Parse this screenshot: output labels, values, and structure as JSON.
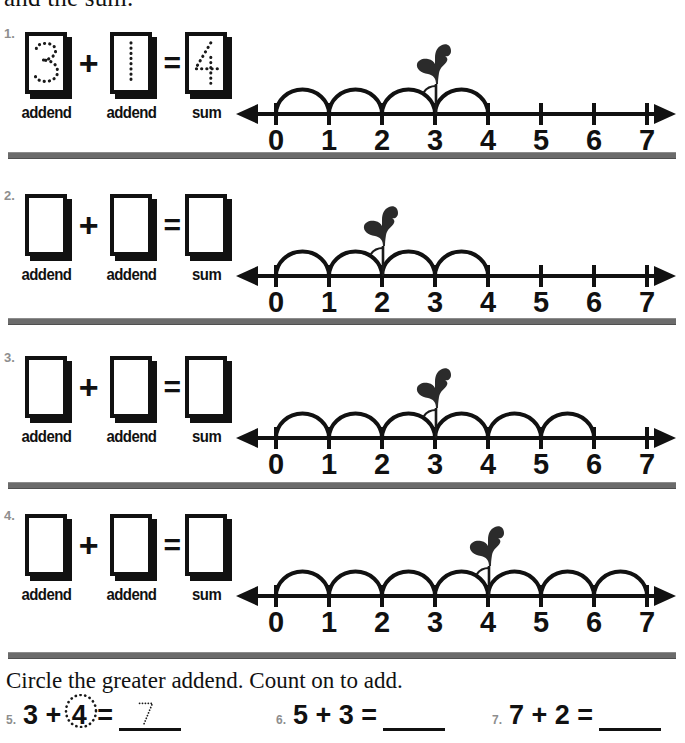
{
  "page": {
    "top_heading": "and the sum.",
    "background": "#ffffff",
    "ink_color": "#111111",
    "divider_color": "#6b6b6b",
    "qnum_color": "#8e8e8e"
  },
  "labels": {
    "addend": "addend",
    "sum": "sum",
    "plus": "+",
    "equals": "="
  },
  "problems": [
    {
      "number": "1.",
      "addend1": "3",
      "addend2": "1",
      "sum": "4",
      "traced": true,
      "numberline": {
        "ticks": [
          "0",
          "1",
          "2",
          "3",
          "4",
          "5",
          "6",
          "7"
        ],
        "min": 0,
        "max": 7,
        "hops": [
          [
            0,
            1
          ],
          [
            1,
            2
          ],
          [
            2,
            3
          ],
          [
            3,
            4
          ]
        ],
        "bird_at": 3,
        "bird_facing": "left"
      }
    },
    {
      "number": "2.",
      "addend1": "",
      "addend2": "",
      "sum": "",
      "traced": false,
      "numberline": {
        "ticks": [
          "0",
          "1",
          "2",
          "3",
          "4",
          "5",
          "6",
          "7"
        ],
        "min": 0,
        "max": 7,
        "hops": [
          [
            0,
            1
          ],
          [
            1,
            2
          ],
          [
            2,
            3
          ],
          [
            3,
            4
          ]
        ],
        "bird_at": 2,
        "bird_facing": "left"
      }
    },
    {
      "number": "3.",
      "addend1": "",
      "addend2": "",
      "sum": "",
      "traced": false,
      "numberline": {
        "ticks": [
          "0",
          "1",
          "2",
          "3",
          "4",
          "5",
          "6",
          "7"
        ],
        "min": 0,
        "max": 7,
        "hops": [
          [
            0,
            1
          ],
          [
            1,
            2
          ],
          [
            2,
            3
          ],
          [
            3,
            4
          ],
          [
            4,
            5
          ],
          [
            5,
            6
          ]
        ],
        "bird_at": 3,
        "bird_facing": "left"
      }
    },
    {
      "number": "4.",
      "addend1": "",
      "addend2": "",
      "sum": "",
      "traced": false,
      "numberline": {
        "ticks": [
          "0",
          "1",
          "2",
          "3",
          "4",
          "5",
          "6",
          "7"
        ],
        "min": 0,
        "max": 7,
        "hops": [
          [
            0,
            1
          ],
          [
            1,
            2
          ],
          [
            2,
            3
          ],
          [
            3,
            4
          ],
          [
            4,
            5
          ],
          [
            5,
            6
          ],
          [
            6,
            7
          ]
        ],
        "bird_at": 4,
        "bird_facing": "left"
      }
    }
  ],
  "bottom": {
    "instruction": "Circle the greater addend. Count on to add.",
    "problems": [
      {
        "number": "5.",
        "left": "3",
        "op": "+",
        "right": "4",
        "right_circled": true,
        "equals": "=",
        "answer": "7",
        "answer_traced": true
      },
      {
        "number": "6.",
        "left": "5",
        "op": "+",
        "right": "3",
        "right_circled": false,
        "equals": "=",
        "answer": "",
        "answer_traced": false
      },
      {
        "number": "7.",
        "left": "7",
        "op": "+",
        "right": "2",
        "right_circled": false,
        "equals": "=",
        "answer": "",
        "answer_traced": false
      }
    ]
  }
}
